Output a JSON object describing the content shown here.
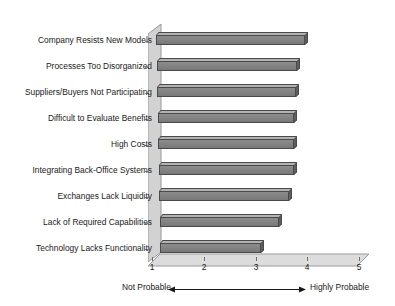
{
  "chart_data": {
    "type": "bar",
    "orientation": "horizontal",
    "title": "",
    "subtitle": "",
    "xlabel": "",
    "ylabel": "",
    "xlim": [
      1,
      5
    ],
    "xticks": [
      "1",
      "2",
      "3",
      "4",
      "5"
    ],
    "grid": false,
    "legend": null,
    "categories": [
      "Company Resists New Models",
      "Processes Too Disorganized",
      "Suppliers/Buyers Not Participating",
      "Difficult to Evaluate Benefits",
      "High Costs",
      "Integrating Back-Office Systems",
      "Exchanges Lack Liquidity",
      "Lack of Required Capabilities",
      "Technology Lacks Functionality"
    ],
    "values": [
      3.95,
      3.8,
      3.78,
      3.75,
      3.75,
      3.75,
      3.65,
      3.45,
      3.1
    ],
    "annotations": {
      "scale_low_label": "Not Probable",
      "scale_high_label": "Highly Probable",
      "scale_arrow": "double-headed-horizontal-arrow"
    },
    "style": {
      "bar_face_color": "#858585",
      "bar_top_color": "#b3b3b3",
      "bar_side_color": "#5e5e5e",
      "bar_edge_color": "#4a4a4a",
      "floor_color": "#dcdcdc",
      "wall_color": "#d2d2d2",
      "background_color": "#ffffff",
      "text_color": "#1a1a1a",
      "three_d": true
    }
  }
}
